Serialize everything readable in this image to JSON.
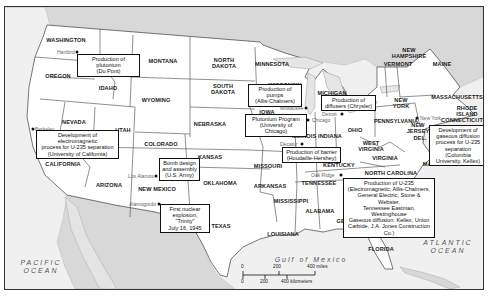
{
  "map": {
    "title": "Manhattan Project sites in the United States",
    "states": [
      {
        "name": "WASHINGTON",
        "x": 61,
        "y": 33
      },
      {
        "name": "OREGON",
        "x": 53,
        "y": 69
      },
      {
        "name": "IDAHO",
        "x": 103,
        "y": 81
      },
      {
        "name": "MONTANA",
        "x": 158,
        "y": 54
      },
      {
        "name": "WYOMING",
        "x": 151,
        "y": 93
      },
      {
        "name": "NORTH\nDAKOTA",
        "x": 219,
        "y": 56
      },
      {
        "name": "SOUTH\nDAKOTA",
        "x": 218,
        "y": 82
      },
      {
        "name": "MINNESOTA",
        "x": 267,
        "y": 57
      },
      {
        "name": "NEVADA",
        "x": 69,
        "y": 115
      },
      {
        "name": "UTAH",
        "x": 118,
        "y": 123
      },
      {
        "name": "COLORADO",
        "x": 156,
        "y": 137
      },
      {
        "name": "NEBRASKA",
        "x": 205,
        "y": 117
      },
      {
        "name": "IOWA",
        "x": 262,
        "y": 105
      },
      {
        "name": "WISCONSIN",
        "x": 280,
        "y": 78
      },
      {
        "name": "MICHIGAN",
        "x": 327,
        "y": 86
      },
      {
        "name": "ILLINOIS",
        "x": 299,
        "y": 129
      },
      {
        "name": "INDIANA",
        "x": 325,
        "y": 129
      },
      {
        "name": "OHIO",
        "x": 350,
        "y": 123
      },
      {
        "name": "PENNSYLVANIA",
        "x": 391,
        "y": 114
      },
      {
        "name": "NEW\nYORK",
        "x": 396,
        "y": 96
      },
      {
        "name": "VERMONT",
        "x": 393,
        "y": 57
      },
      {
        "name": "NEW\nHAMPSHIRE",
        "x": 404,
        "y": 46
      },
      {
        "name": "MAINE",
        "x": 437,
        "y": 57
      },
      {
        "name": "MASSACHUSETTS",
        "x": 452,
        "y": 90
      },
      {
        "name": "RHODE\nISLAND",
        "x": 462,
        "y": 104
      },
      {
        "name": "CONNECTICUT",
        "x": 457,
        "y": 113
      },
      {
        "name": "NEW\nJERSEY",
        "x": 413,
        "y": 121
      },
      {
        "name": "DEL.",
        "x": 415,
        "y": 131
      },
      {
        "name": "MARYLAND",
        "x": 434,
        "y": 157
      },
      {
        "name": "WEST\nVIRGINIA",
        "x": 366,
        "y": 139
      },
      {
        "name": "VIRGINIA",
        "x": 380,
        "y": 151
      },
      {
        "name": "KENTUCKY",
        "x": 334,
        "y": 158
      },
      {
        "name": "NORTH CAROLINA",
        "x": 386,
        "y": 166
      },
      {
        "name": "TENNESSEE",
        "x": 314,
        "y": 176
      },
      {
        "name": "KANSAS",
        "x": 205,
        "y": 150
      },
      {
        "name": "MISSOURI",
        "x": 263,
        "y": 159
      },
      {
        "name": "OKLAHOMA",
        "x": 215,
        "y": 176
      },
      {
        "name": "ARKANSAS",
        "x": 265,
        "y": 179
      },
      {
        "name": "MISSISSIPPI",
        "x": 286,
        "y": 194
      },
      {
        "name": "ALABAMA",
        "x": 315,
        "y": 204
      },
      {
        "name": "GEORGIA",
        "x": 345,
        "y": 214
      },
      {
        "name": "LOUISIANA",
        "x": 278,
        "y": 227
      },
      {
        "name": "TEXAS",
        "x": 216,
        "y": 219
      },
      {
        "name": "FLORIDA",
        "x": 376,
        "y": 242
      },
      {
        "name": "CALIFORNIA",
        "x": 58,
        "y": 157
      },
      {
        "name": "ARIZONA",
        "x": 104,
        "y": 178
      },
      {
        "name": "NEW MEXICO",
        "x": 152,
        "y": 182
      }
    ],
    "cities": [
      {
        "name": "Hanford",
        "x": 72,
        "y": 45,
        "label_dx": -20
      },
      {
        "name": "Berkeley",
        "x": 28,
        "y": 122,
        "label_dx": 2
      },
      {
        "name": "Los Alamos",
        "x": 151,
        "y": 169,
        "label_dx": -28
      },
      {
        "name": "Alamogordo",
        "x": 154,
        "y": 197,
        "label_dx": -30
      },
      {
        "name": "Milwaukee",
        "x": 301,
        "y": 101,
        "label_dx": -26
      },
      {
        "name": "Chicago",
        "x": 303,
        "y": 113,
        "label_dx": 4
      },
      {
        "name": "Decatur",
        "x": 297,
        "y": 137,
        "label_dx": -22
      },
      {
        "name": "Detroit",
        "x": 337,
        "y": 107,
        "label_dx": -20
      },
      {
        "name": "Oak Ridge",
        "x": 336,
        "y": 168,
        "label_dx": -30
      },
      {
        "name": "New York",
        "x": 412,
        "y": 111,
        "label_dx": 3
      }
    ],
    "callouts": [
      {
        "text": "Production of plutonium\n(Du Pont)",
        "x": 72,
        "y": 47,
        "w": 63,
        "h": 15
      },
      {
        "text": "Development of electromagnetic\nprocess for U-235 separation\n(University of California)",
        "x": 31,
        "y": 123,
        "w": 83,
        "h": 22
      },
      {
        "text": "Bomb design\nand assembly\n(U.S. Army)",
        "x": 154,
        "y": 151,
        "w": 41,
        "h": 22
      },
      {
        "text": "First nuclear\nexplosion, \"Trinity\"\nJuly 16, 1945",
        "x": 155,
        "y": 197,
        "w": 50,
        "h": 22
      },
      {
        "text": "Production of pumps\n(Allis-Chalmers)",
        "x": 243,
        "y": 77,
        "w": 54,
        "h": 15
      },
      {
        "text": "Plutonium Program\n(University of Chicago)",
        "x": 240,
        "y": 107,
        "w": 62,
        "h": 15
      },
      {
        "text": "Production of\ndiffusers (Chrysler)",
        "x": 316,
        "y": 88,
        "w": 55,
        "h": 15
      },
      {
        "text": "Production of barrier\n(Houdaille-Hershey)",
        "x": 277,
        "y": 140,
        "w": 59,
        "h": 15
      },
      {
        "text": "Development of\ngaseous diffusion\nprocess for U-235\nseparation (Columbia\nUniversity, Kellex)",
        "x": 424,
        "y": 118,
        "w": 58,
        "h": 35
      },
      {
        "text": "Production of U-235\n(Electromagnetic: Allis-Chalmers,\nGeneral Electric, Stone & Webster,\nTennessee Eastman, Westinghouse\nGaseous diffusion: Kellex, Union\nCarbide, J.A. Jones Construction Co.)",
        "x": 338,
        "y": 171,
        "w": 92,
        "h": 41
      }
    ],
    "oceans": [
      {
        "name": "PACIFIC\nOCEAN",
        "x": 36,
        "y": 260
      },
      {
        "name": "ATLANTIC\nOCEAN",
        "x": 443,
        "y": 240
      },
      {
        "name": "Gulf of Mexico",
        "x": 306,
        "y": 253
      }
    ],
    "scale": {
      "miles_labels": [
        "0",
        "200",
        "400 miles"
      ],
      "km_labels": [
        "0",
        "200",
        "400 kilometers"
      ]
    },
    "colors": {
      "land_us": "#ffffff",
      "land_foreign": "#d9d9d9",
      "water": "#f2f2f2",
      "border": "#333333",
      "callout_border": "#111111"
    }
  }
}
